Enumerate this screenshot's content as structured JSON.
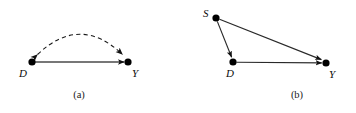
{
  "figure": {
    "width": 356,
    "height": 113,
    "background_color": "#ffffff",
    "stroke_color": "#1a1a1a",
    "node_fill_color": "#000000"
  },
  "panels": [
    {
      "id": "a",
      "caption": "(a)",
      "caption_x": 78,
      "caption_y": 90,
      "nodes": [
        {
          "name": "D",
          "label": "D",
          "cx": 32,
          "cy": 62,
          "r": 3.6,
          "label_x": 19,
          "label_y": 68
        },
        {
          "name": "Y",
          "label": "Y",
          "cx": 128,
          "cy": 62,
          "r": 3.6,
          "label_x": 132,
          "label_y": 68
        }
      ],
      "edges": [
        {
          "name": "d-to-y-directed",
          "from": "D",
          "to": "Y",
          "style": "solid",
          "shape": "straight",
          "arrowheads": "end"
        },
        {
          "name": "d-y-bidirected",
          "from": "D",
          "to": "Y",
          "style": "dashed",
          "shape": "arc",
          "arrowheads": "both"
        }
      ]
    },
    {
      "id": "b",
      "caption": "(b)",
      "caption_x": 297,
      "caption_y": 90,
      "nodes": [
        {
          "name": "S",
          "label": "S",
          "cx": 216,
          "cy": 18,
          "r": 3.6,
          "label_x": 203,
          "label_y": 10
        },
        {
          "name": "D",
          "label": "D",
          "cx": 233,
          "cy": 62,
          "r": 3.6,
          "label_x": 226,
          "label_y": 70
        },
        {
          "name": "Y",
          "label": "Y",
          "cx": 326,
          "cy": 63,
          "r": 3.6,
          "label_x": 329,
          "label_y": 69
        }
      ],
      "edges": [
        {
          "name": "s-to-d",
          "from": "S",
          "to": "D",
          "style": "solid",
          "shape": "straight",
          "arrowheads": "end"
        },
        {
          "name": "s-to-y",
          "from": "S",
          "to": "Y",
          "style": "solid",
          "shape": "straight",
          "arrowheads": "end"
        },
        {
          "name": "d-to-y",
          "from": "D",
          "to": "Y",
          "style": "solid",
          "shape": "straight",
          "arrowheads": "end"
        }
      ]
    }
  ]
}
